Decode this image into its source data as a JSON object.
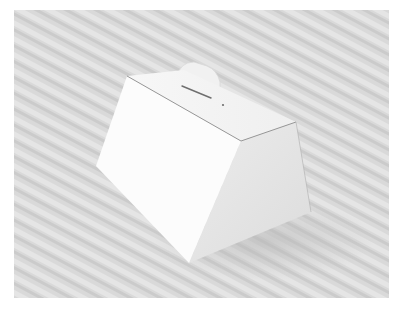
{
  "image": {
    "subject": "white cardboard box with carry handle",
    "background_description": "light grey diagonally striped fabric surface",
    "colors": {
      "page_background": "#ffffff",
      "surface_base": "#d8d8d8",
      "surface_stripe_light": "#e6e6e6",
      "surface_stripe_dark": "#c8c8c8",
      "box_front": "#fbfbfb",
      "box_top": "#f4f4f4",
      "box_side": "#e7e7e7",
      "handle": "#f0f0f0",
      "edge_line": "#8a8a8a",
      "slot": "#6e6e6e"
    }
  }
}
